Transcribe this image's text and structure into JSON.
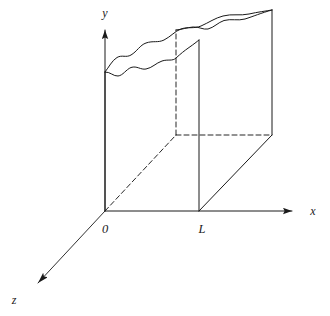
{
  "figure": {
    "kind": "3d-axes-diagram",
    "background_color": "#ffffff",
    "line_color": "#1a1a1a",
    "solid_stroke_width": 1.0,
    "dashed_stroke_width": 1.0,
    "dash_pattern": "5,3"
  },
  "axes": {
    "x": {
      "label": "x",
      "label_position": {
        "x": 313,
        "y": 215
      },
      "origin": {
        "x": 105,
        "y": 211
      },
      "end": {
        "x": 300,
        "y": 211
      },
      "arrow": "right"
    },
    "y": {
      "label": "y",
      "label_position": {
        "x": 104,
        "y": 16
      },
      "origin": {
        "x": 105,
        "y": 211
      },
      "end": {
        "x": 105,
        "y": 22
      },
      "arrow": "up"
    },
    "z": {
      "label": "z",
      "label_position": {
        "x": 14,
        "y": 302
      },
      "origin": {
        "x": 105,
        "y": 211
      },
      "end": {
        "x": 30,
        "y": 290
      },
      "arrow": "down-left"
    }
  },
  "tick_labels": [
    {
      "name": "origin-label",
      "text": "0",
      "x": 102,
      "y": 231
    },
    {
      "name": "length-label",
      "text": "L",
      "x": 199,
      "y": 231
    }
  ],
  "geometry": {
    "front_bottom_left": {
      "x": 105,
      "y": 211
    },
    "front_bottom_right": {
      "x": 199,
      "y": 211
    },
    "front_top_left": {
      "x": 105,
      "y": 72
    },
    "front_top_right": {
      "x": 199,
      "y": 40
    },
    "back_bottom_left": {
      "x": 176,
      "y": 135
    },
    "back_bottom_right": {
      "x": 272,
      "y": 135
    },
    "back_top_left": {
      "x": 176,
      "y": 30
    },
    "back_top_right": {
      "x": 272,
      "y": 10
    },
    "depth_offset": {
      "dx": 72,
      "dy": -76
    }
  },
  "edges": {
    "front_left_vertical": {
      "style": "solid",
      "from": "front_bottom_left",
      "to": "front_top_left"
    },
    "front_right_vertical": {
      "style": "solid",
      "from": "front_bottom_right",
      "to": "front_top_right"
    },
    "back_left_vertical": {
      "style": "dashed",
      "from": "back_bottom_left",
      "to": "back_top_left"
    },
    "back_right_vertical": {
      "style": "solid",
      "from": "back_bottom_right",
      "to": "back_top_right"
    },
    "bottom_front_horizontal": {
      "style": "solid",
      "note": "lies along x axis from 0 to L"
    },
    "bottom_back_horizontal": {
      "style": "dashed",
      "from": "back_bottom_left",
      "to": "back_bottom_right"
    },
    "bottom_left_diagonal": {
      "style": "dashed",
      "from": "front_bottom_left",
      "to": "back_bottom_left"
    },
    "bottom_right_diagonal": {
      "style": "solid",
      "from": "front_bottom_right",
      "to": "back_bottom_right"
    }
  },
  "rough_surface": {
    "name": "wavy-top-surface",
    "front_curve_path": "M 105,72 C 110,71 113,76 118,76 C 123,76 126,70 131,68 C 137,66 140,70 146,69 C 152,68 156,63 162,61 C 168,59 172,61 176,58 C 181,55 184,51 189,48 C 194,45 196,42 199,40",
    "back_curve_path": "M 105,72 C 109,67 112,61 117,58 C 122,55 126,58 131,55 C 137,52 140,45 146,43 C 153,41 158,43 164,40 C 171,37 175,31 181,29 C 188,27 194,29 201,26 C 209,23 215,18 223,16 C 232,14 240,16 249,14 C 258,12 266,11 272,10",
    "inner_ridge_path": "M 176,30 C 182,29 187,27 193,27 C 199,27 203,30 208,29 C 214,28 218,23 224,21 C 231,19 238,21 245,19 C 253,17 261,13 272,10",
    "description": "Irregular rough boundary drawn as two nearly parallel wavy curves spanning the top of the slab"
  }
}
